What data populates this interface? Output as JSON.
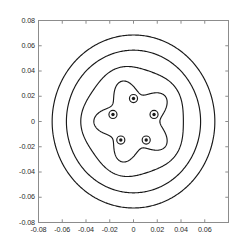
{
  "figure": {
    "background_color": "#ffffff",
    "axes_color": "#8c8c8c",
    "contour_color": "#1a1a1a",
    "label_color": "#2b2b2b"
  },
  "chart_data": {
    "type": "line",
    "title": "",
    "subtitle": "",
    "xlabel": "",
    "ylabel": "",
    "xlim": [
      -0.08,
      0.08
    ],
    "ylim": [
      -0.08,
      0.08
    ],
    "grid": false,
    "legend": null,
    "legend_position": "none",
    "aspect": "equal",
    "x_tick_values": [
      -0.08,
      -0.06,
      -0.04,
      -0.02,
      0,
      0.02,
      0.04,
      0.06,
      0.08
    ],
    "x_tick_labels": [
      "-0.08",
      "-0.06",
      "-0.04",
      "-0.02",
      "0",
      "0.02",
      "0.04",
      "0.06",
      ""
    ],
    "y_tick_values": [
      -0.08,
      -0.06,
      -0.04,
      -0.02,
      0,
      0.02,
      0.04,
      0.06,
      0.08
    ],
    "y_tick_labels": [
      "-0.08",
      "-0.06",
      "-0.04",
      "-0.02",
      "0",
      "0.02",
      "0.04",
      "0.06",
      "0.08"
    ],
    "series": [
      {
        "name": "outer-contour-1",
        "kind": "closed-contour",
        "shape": "circle",
        "center": [
          0.0,
          0.0
        ],
        "radius": 0.0685,
        "lobes": 0,
        "amplitude": 0.0
      },
      {
        "name": "outer-contour-2",
        "kind": "closed-contour",
        "shape": "circle",
        "center": [
          0.0,
          0.0
        ],
        "radius": 0.0565,
        "lobes": 0,
        "amplitude": 0.0
      },
      {
        "name": "outer-contour-3",
        "kind": "closed-contour",
        "shape": "near-circle",
        "center": [
          0.0,
          0.0
        ],
        "radius": 0.0432,
        "lobes": 5,
        "amplitude": 0.0012
      },
      {
        "name": "inner-scalloped-contour",
        "kind": "closed-contour",
        "shape": "pentagonal-scalloped",
        "center": [
          0.0,
          0.0
        ],
        "radius": 0.0278,
        "lobes": 5,
        "amplitude": 0.0056
      }
    ],
    "vortices": {
      "count": 5,
      "orbit_radius": 0.0182,
      "core_radius": 0.0034,
      "points": [
        {
          "label": "v1",
          "x": 0.0,
          "y": 0.0182
        },
        {
          "label": "v2",
          "x": 0.0173,
          "y": 0.0056
        },
        {
          "label": "v3",
          "x": 0.0107,
          "y": -0.0147
        },
        {
          "label": "v4",
          "x": -0.0107,
          "y": -0.0147
        },
        {
          "label": "v5",
          "x": -0.0173,
          "y": 0.0056
        }
      ]
    }
  }
}
